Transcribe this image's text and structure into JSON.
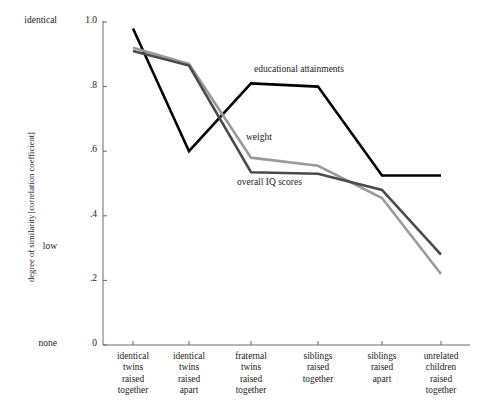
{
  "chart_data": {
    "type": "line",
    "title": "",
    "xlabel": "",
    "ylabel": "degree of similarity [correlation coefficient]",
    "ylabel_line1": "degree of similarity",
    "ylabel_line2": "[correlation coefficient]",
    "ylim": [
      0,
      1.0
    ],
    "grid": false,
    "legend_position": "inline-annotations",
    "categories": [
      "identical twins raised together",
      "identical twins raised apart",
      "fraternal twins raised together",
      "siblings raised together",
      "siblings raised apart",
      "unrelated children raised together"
    ],
    "category_lines": [
      [
        "identical",
        "twins",
        "raised",
        "together"
      ],
      [
        "identical",
        "twins",
        "raised",
        "apart"
      ],
      [
        "fraternal",
        "twins",
        "raised",
        "together"
      ],
      [
        "siblings",
        "raised",
        "together"
      ],
      [
        "siblings",
        "raised",
        "apart"
      ],
      [
        "unrelated",
        "children",
        "raised",
        "together"
      ]
    ],
    "ytick_values": [
      1.0,
      0.8,
      0.6,
      0.4,
      0.2,
      0
    ],
    "ytick_labels": [
      "1.0",
      ".8",
      ".6",
      ".4",
      ".2",
      "0"
    ],
    "yaxis_special_labels": [
      {
        "text": "identical",
        "value": 1.0
      },
      {
        "text": "low",
        "value": 0.3
      },
      {
        "text": "none",
        "value": 0.0
      }
    ],
    "series": [
      {
        "name": "educational attainments",
        "color": "#000000",
        "width": 2.6,
        "values": [
          0.98,
          0.6,
          0.81,
          0.8,
          0.525,
          0.525
        ]
      },
      {
        "name": "weight",
        "color": "#9a9a9a",
        "width": 2.6,
        "values": [
          0.92,
          0.87,
          0.58,
          0.555,
          0.455,
          0.22
        ]
      },
      {
        "name": "overall IQ scores",
        "color": "#4a4a4a",
        "width": 2.6,
        "values": [
          0.91,
          0.865,
          0.535,
          0.53,
          0.48,
          0.28
        ]
      }
    ],
    "annotations": [
      {
        "text": "educational attainments",
        "series": "educational attainments"
      },
      {
        "text": "weight",
        "series": "weight"
      },
      {
        "text": "overall IQ scores",
        "series": "overall IQ scores"
      }
    ],
    "axis_color": "#6b6b6b"
  }
}
